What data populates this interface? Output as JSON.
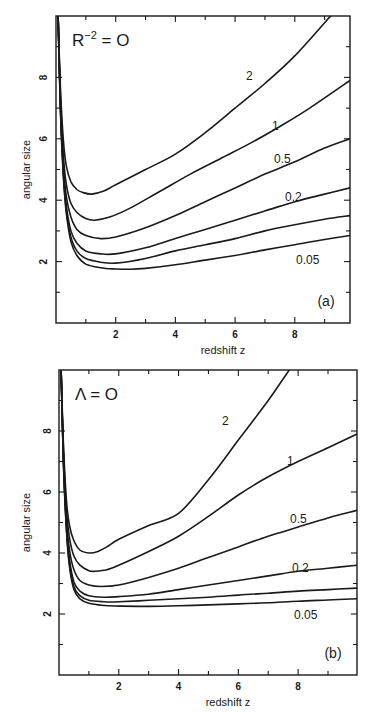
{
  "chart_data": [
    {
      "type": "line",
      "panel_label": "(a)",
      "annotation": "R⁻² = 0",
      "annotation_base": "R",
      "annotation_sup": "−2",
      "annotation_rest": " = O",
      "title": "",
      "xlabel": "redshift  z",
      "ylabel": "angular size",
      "xlim": [
        0,
        9.85
      ],
      "ylim": [
        0,
        10
      ],
      "xticks": [
        2,
        4,
        6,
        8
      ],
      "yticks": [
        2,
        4,
        6,
        8
      ],
      "minor_xticks": [
        1,
        3,
        5,
        7,
        9
      ],
      "minor_yticks": [
        1,
        3,
        5,
        7,
        9
      ],
      "grid": false,
      "legend": "inline curve labels",
      "frame_px": {
        "x0": 56,
        "y0": 16,
        "x1": 350,
        "y1": 323
      },
      "series": [
        {
          "name": "2",
          "label_pos": [
            246,
            80
          ],
          "x": [
            0.07,
            0.15,
            0.25,
            0.35,
            0.5,
            0.7,
            0.9,
            1.2,
            1.6,
            2.0,
            3.0,
            4.0,
            5.0,
            6.0,
            7.0,
            8.0,
            9.2
          ],
          "y": [
            10,
            7.6,
            5.9,
            5.1,
            4.6,
            4.35,
            4.25,
            4.2,
            4.3,
            4.5,
            5.0,
            5.5,
            6.2,
            7.0,
            7.8,
            8.7,
            10
          ]
        },
        {
          "name": "1",
          "label_pos": [
            272,
            130
          ],
          "x": [
            0.07,
            0.15,
            0.25,
            0.35,
            0.5,
            0.7,
            1.0,
            1.3,
            1.8,
            2.5,
            3.5,
            4.5,
            5.5,
            6.5,
            7.5,
            8.5,
            9.85
          ],
          "y": [
            10,
            7.3,
            5.4,
            4.5,
            3.9,
            3.6,
            3.4,
            3.35,
            3.45,
            3.75,
            4.3,
            4.85,
            5.35,
            5.85,
            6.4,
            7.0,
            7.9
          ]
        },
        {
          "name": "0.5",
          "label_pos": [
            274,
            163
          ],
          "x": [
            0.07,
            0.15,
            0.25,
            0.35,
            0.5,
            0.7,
            1.0,
            1.5,
            2.0,
            3.0,
            4.0,
            5.0,
            6.0,
            7.0,
            8.0,
            9.0,
            9.85
          ],
          "y": [
            10,
            7.1,
            5.1,
            4.1,
            3.45,
            3.05,
            2.85,
            2.75,
            2.8,
            3.1,
            3.5,
            3.95,
            4.4,
            4.85,
            5.25,
            5.7,
            6.0
          ]
        },
        {
          "name": "0.2",
          "label_pos": [
            285,
            201
          ],
          "x": [
            0.07,
            0.15,
            0.25,
            0.35,
            0.5,
            0.7,
            1.0,
            1.5,
            2.0,
            3.0,
            4.0,
            5.0,
            6.0,
            7.0,
            8.0,
            9.0,
            9.85
          ],
          "y": [
            10,
            7.0,
            4.9,
            3.8,
            3.0,
            2.6,
            2.35,
            2.25,
            2.25,
            2.45,
            2.75,
            3.05,
            3.35,
            3.65,
            3.95,
            4.2,
            4.4
          ]
        },
        {
          "name": "0.1",
          "label_pos": null,
          "x": [
            0.07,
            0.15,
            0.25,
            0.35,
            0.5,
            0.7,
            1.0,
            1.5,
            2.0,
            3.0,
            4.0,
            5.0,
            6.0,
            7.0,
            8.0,
            9.0,
            9.85
          ],
          "y": [
            10,
            6.9,
            4.8,
            3.65,
            2.8,
            2.35,
            2.1,
            1.98,
            1.95,
            2.1,
            2.35,
            2.55,
            2.75,
            3.0,
            3.2,
            3.38,
            3.5
          ]
        },
        {
          "name": "0.05",
          "label_pos": [
            296,
            264
          ],
          "x": [
            0.07,
            0.15,
            0.25,
            0.35,
            0.5,
            0.7,
            1.0,
            1.5,
            2.0,
            2.5,
            3.0,
            4.0,
            5.0,
            6.0,
            7.0,
            8.0,
            9.0,
            9.85
          ],
          "y": [
            10,
            6.85,
            4.7,
            3.55,
            2.65,
            2.2,
            1.92,
            1.8,
            1.76,
            1.75,
            1.78,
            1.9,
            2.05,
            2.2,
            2.38,
            2.55,
            2.72,
            2.85
          ]
        }
      ]
    },
    {
      "type": "line",
      "panel_label": "(b)",
      "annotation": "Λ = 0",
      "annotation_base": "Λ",
      "annotation_sup": "",
      "annotation_rest": " = O",
      "title": "",
      "xlabel": "redshift  z",
      "ylabel": "angular size",
      "xlim": [
        0,
        9.97
      ],
      "ylim": [
        0,
        10
      ],
      "xticks": [
        2,
        4,
        6,
        8
      ],
      "yticks": [
        2,
        4,
        6,
        8
      ],
      "minor_xticks": [
        1,
        3,
        5,
        7,
        9
      ],
      "minor_yticks": [
        1,
        3,
        5,
        7,
        9
      ],
      "grid": false,
      "legend": "inline curve labels",
      "frame_px": {
        "x0": 59,
        "y0": 370,
        "x1": 357,
        "y1": 675
      },
      "series": [
        {
          "name": "2",
          "label_pos": [
            222,
            425
          ],
          "x": [
            0.07,
            0.15,
            0.25,
            0.35,
            0.5,
            0.7,
            1.0,
            1.3,
            1.6,
            2.0,
            3.0,
            4.0,
            5.0,
            6.0,
            7.0,
            7.7
          ],
          "y": [
            10,
            7.5,
            5.7,
            4.9,
            4.4,
            4.1,
            4.0,
            4.05,
            4.2,
            4.45,
            4.9,
            5.3,
            6.4,
            7.7,
            9.0,
            10
          ]
        },
        {
          "name": "1",
          "label_pos": [
            287,
            465
          ],
          "x": [
            0.07,
            0.15,
            0.25,
            0.35,
            0.5,
            0.7,
            1.0,
            1.2,
            1.6,
            2.0,
            3.0,
            4.0,
            5.0,
            6.0,
            7.0,
            8.0,
            9.0,
            9.97
          ],
          "y": [
            10,
            7.3,
            5.4,
            4.5,
            3.9,
            3.6,
            3.42,
            3.4,
            3.45,
            3.6,
            4.05,
            4.55,
            5.2,
            5.9,
            6.5,
            7.0,
            7.45,
            7.9
          ]
        },
        {
          "name": "0.5",
          "label_pos": [
            290,
            523
          ],
          "x": [
            0.07,
            0.15,
            0.25,
            0.35,
            0.5,
            0.7,
            1.0,
            1.4,
            2.0,
            3.0,
            4.0,
            5.0,
            6.0,
            7.0,
            8.0,
            9.0,
            9.97
          ],
          "y": [
            10,
            7.1,
            5.1,
            4.1,
            3.45,
            3.1,
            2.95,
            2.9,
            2.95,
            3.2,
            3.5,
            3.85,
            4.2,
            4.55,
            4.85,
            5.15,
            5.4
          ]
        },
        {
          "name": "0.2",
          "label_pos": [
            292,
            572
          ],
          "x": [
            0.07,
            0.15,
            0.25,
            0.35,
            0.5,
            0.7,
            1.0,
            1.5,
            2.0,
            3.0,
            4.0,
            5.0,
            6.0,
            7.0,
            8.0,
            9.0,
            9.97
          ],
          "y": [
            10,
            7.0,
            4.9,
            3.8,
            3.05,
            2.75,
            2.6,
            2.55,
            2.57,
            2.65,
            2.8,
            2.95,
            3.1,
            3.25,
            3.4,
            3.5,
            3.6
          ]
        },
        {
          "name": "0.1",
          "label_pos": null,
          "x": [
            0.07,
            0.15,
            0.25,
            0.35,
            0.5,
            0.7,
            1.0,
            1.5,
            2.0,
            3.0,
            4.0,
            5.0,
            6.0,
            7.0,
            8.0,
            9.0,
            9.97
          ],
          "y": [
            10,
            6.9,
            4.8,
            3.65,
            2.9,
            2.6,
            2.45,
            2.4,
            2.4,
            2.45,
            2.5,
            2.55,
            2.62,
            2.68,
            2.75,
            2.8,
            2.85
          ]
        },
        {
          "name": "0.05",
          "label_pos": [
            294,
            619
          ],
          "x": [
            0.07,
            0.15,
            0.25,
            0.35,
            0.5,
            0.7,
            1.0,
            1.5,
            2.0,
            3.0,
            4.0,
            5.0,
            6.0,
            7.0,
            8.0,
            9.0,
            9.97
          ],
          "y": [
            10,
            6.85,
            4.7,
            3.55,
            2.8,
            2.5,
            2.35,
            2.28,
            2.26,
            2.25,
            2.27,
            2.3,
            2.33,
            2.37,
            2.42,
            2.46,
            2.5
          ]
        }
      ]
    }
  ],
  "figure": {
    "width": 372,
    "height": 712,
    "ink_color": "#1a1a1a",
    "background": "#ffffff"
  }
}
